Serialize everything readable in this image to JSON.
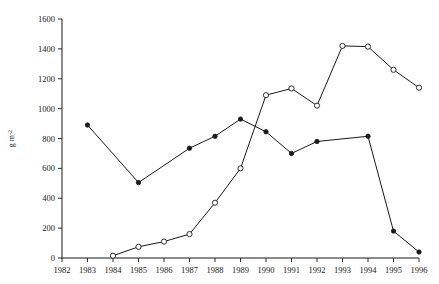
{
  "chart_data": {
    "type": "line",
    "title": "",
    "subtitle": "",
    "xlabel": "",
    "ylabel": "g m^-2",
    "xlim": [
      1982,
      1996
    ],
    "ylim": [
      0,
      1600
    ],
    "grid": false,
    "legend": "none",
    "x_ticks": [
      1982,
      1983,
      1984,
      1985,
      1986,
      1987,
      1988,
      1989,
      1990,
      1991,
      1992,
      1993,
      1994,
      1995,
      1996
    ],
    "y_ticks": [
      0,
      200,
      400,
      600,
      800,
      1000,
      1200,
      1400,
      1600
    ],
    "x_tick_labels": [
      "1982",
      "1983",
      "1984",
      "1985",
      "1986",
      "1987",
      "1988",
      "1989",
      "1990",
      "1991",
      "1992",
      "1993",
      "1994",
      "1995",
      "1996"
    ],
    "y_tick_labels": [
      "0",
      "200",
      "400",
      "600",
      "800",
      "1000",
      "1200",
      "1400",
      "1600"
    ],
    "series": [
      {
        "name": "filled-circle-series",
        "marker": "filled-circle",
        "x": [
          1983,
          1985,
          1987,
          1988,
          1989,
          1990,
          1991,
          1992,
          1994,
          1995,
          1996
        ],
        "values": [
          890,
          505,
          735,
          815,
          930,
          845,
          700,
          780,
          815,
          180,
          40
        ]
      },
      {
        "name": "open-circle-series",
        "marker": "open-circle",
        "x": [
          1984,
          1985,
          1986,
          1987,
          1988,
          1989,
          1990,
          1991,
          1992,
          1993,
          1994,
          1995,
          1996
        ],
        "values": [
          15,
          75,
          110,
          160,
          370,
          600,
          1090,
          1135,
          1020,
          1420,
          1415,
          1260,
          1140
        ]
      }
    ]
  },
  "axis": {
    "y_label": "g m^-2",
    "y_label_main": "g m",
    "y_label_sup": "-2"
  },
  "colors": {
    "ink": "#1a1a1a",
    "background": "#ffffff",
    "marker_fill_open": "#ffffff"
  }
}
